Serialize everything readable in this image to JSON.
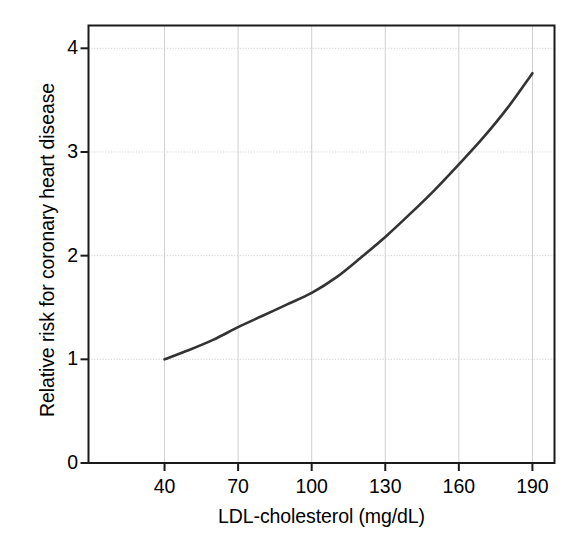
{
  "chart_data": {
    "type": "line",
    "title": "",
    "xlabel": "LDL-cholesterol (mg/dL)",
    "ylabel": "Relative risk for coronary heart disease",
    "xlim": [
      9,
      199
    ],
    "ylim": [
      0,
      4.22
    ],
    "xticks": [
      40,
      70,
      100,
      130,
      160,
      190
    ],
    "xtick_labels": [
      "40",
      "70",
      "100",
      "130",
      "160",
      "190"
    ],
    "yticks": [
      0,
      1,
      2,
      3,
      4
    ],
    "ytick_labels": [
      "0",
      "1",
      "2",
      "3",
      "4"
    ],
    "grid": true,
    "grid_color": "#d0d0d0",
    "legend": null,
    "series": [
      {
        "name": "Relative risk",
        "color": "#333333",
        "line_width": 2.6,
        "x": [
          40,
          50,
          60,
          70,
          80,
          90,
          100,
          110,
          120,
          130,
          140,
          150,
          160,
          170,
          180,
          190
        ],
        "y": [
          1.0,
          1.09,
          1.19,
          1.31,
          1.42,
          1.53,
          1.64,
          1.79,
          1.98,
          2.18,
          2.4,
          2.63,
          2.88,
          3.14,
          3.43,
          3.76
        ]
      }
    ]
  },
  "axes": {
    "x_axis_label": "LDL-cholesterol (mg/dL)",
    "y_axis_label": "Relative risk for coronary heart disease"
  }
}
